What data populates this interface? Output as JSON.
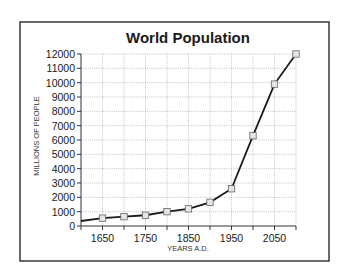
{
  "chart_data": {
    "type": "line",
    "title": "World Population",
    "xlabel": "YEARS A.D.",
    "ylabel": "MILLIONS OF PEOPLE",
    "xlim": [
      1600,
      2100
    ],
    "ylim": [
      0,
      12000
    ],
    "grid": true,
    "x_ticks": [
      1600,
      1650,
      1700,
      1750,
      1800,
      1850,
      1900,
      1950,
      2000,
      2050,
      2100
    ],
    "x_tick_labels": [
      {
        "value": 1650,
        "label": "1650"
      },
      {
        "value": 1750,
        "label": "1750"
      },
      {
        "value": 1850,
        "label": "1850"
      },
      {
        "value": 1950,
        "label": "1950"
      },
      {
        "value": 2050,
        "label": "2050"
      }
    ],
    "y_ticks": [
      0,
      1000,
      2000,
      3000,
      4000,
      5000,
      6000,
      7000,
      8000,
      9000,
      10000,
      11000,
      12000
    ],
    "y_tick_labels": [
      "0",
      "1000",
      "2000",
      "3000",
      "4000",
      "5000",
      "6000",
      "7000",
      "8000",
      "9000",
      "10000",
      "11000",
      "12000"
    ],
    "series": [
      {
        "name": "World Population",
        "x": [
          1600,
          1650,
          1700,
          1750,
          1800,
          1850,
          1900,
          1950,
          2000,
          2050,
          2100
        ],
        "values": [
          350,
          550,
          650,
          750,
          1000,
          1200,
          1650,
          2600,
          6300,
          9900,
          12000
        ],
        "markers": [
          false,
          true,
          true,
          true,
          true,
          true,
          true,
          true,
          true,
          true,
          true
        ]
      }
    ],
    "legend": "none"
  }
}
